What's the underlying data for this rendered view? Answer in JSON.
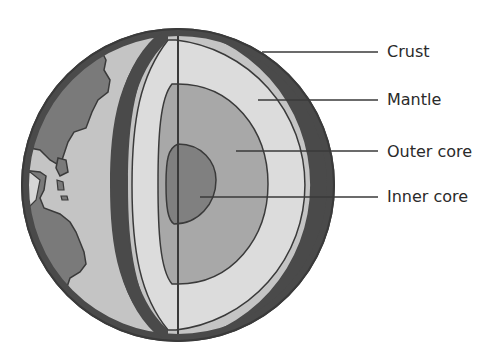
{
  "diagram": {
    "colors": {
      "outline": "#3a3a3a",
      "crust": "#4a4a4a",
      "continent": "#7a7a7a",
      "ocean_surface": "#c4c4c4",
      "mantle": "#dcdcdc",
      "outer_core": "#a8a8a8",
      "inner_core": "#808080",
      "leader_line": "#3a3a3a"
    },
    "labels": [
      {
        "id": "crust",
        "text": "Crust",
        "x": 387,
        "y": 44
      },
      {
        "id": "mantle",
        "text": "Mantle",
        "x": 387,
        "y": 92
      },
      {
        "id": "outer-core",
        "text": "Outer core",
        "x": 387,
        "y": 145
      },
      {
        "id": "inner-core",
        "text": "Inner core",
        "x": 387,
        "y": 190
      }
    ]
  }
}
